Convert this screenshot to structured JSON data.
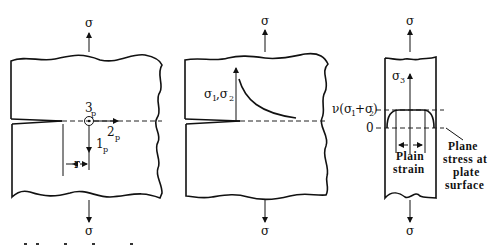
{
  "figure": {
    "panel1": {
      "load_top": "σ",
      "load_bottom": "σ",
      "axis3": "3",
      "axis3_sub": "p",
      "axis2": "2",
      "axis2_sub": "p",
      "axis1": "1",
      "axis1_sub": "p",
      "distance": "r"
    },
    "panel2": {
      "load_top": "σ",
      "load_bottom": "σ",
      "stress_label_a": "σ",
      "stress_label_a_sub": "1",
      "stress_label_sep": ",σ",
      "stress_label_b_sub": "2"
    },
    "panel3": {
      "load_top": "σ",
      "load_bottom": "σ",
      "stress_axis": "σ",
      "stress_axis_sub": "3",
      "level_label_prefix": "ν(σ",
      "level_label_sub1": "1",
      "level_label_mid": "+σ",
      "level_label_sub2": "2",
      "level_label_suffix": ")",
      "zero_label": "0",
      "plain_strain_line1": "Plain",
      "plain_strain_line2": "strain",
      "plane_stress_lines": [
        "Plane",
        "stress at",
        "plate",
        "surface"
      ]
    }
  }
}
